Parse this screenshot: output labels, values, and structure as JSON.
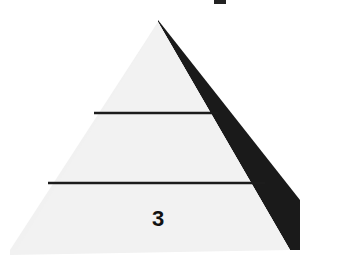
{
  "diagram": {
    "type": "pyramid",
    "tiers": [
      {
        "index": 1,
        "label": ""
      },
      {
        "index": 2,
        "label": ""
      },
      {
        "index": 3,
        "label": "3"
      }
    ],
    "colors": {
      "face": "#f1f1f1",
      "shadow": "#1a1a1a",
      "divider": "#1c1c1c",
      "text": "#111111",
      "background": "#ffffff"
    }
  },
  "top_text_fragment": ""
}
